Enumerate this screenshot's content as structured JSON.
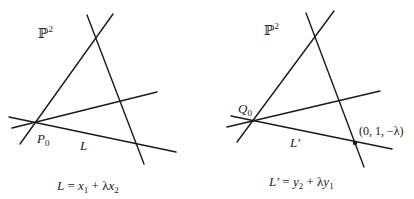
{
  "left_panel": {
    "space_label": "ℙ",
    "space_sup": "2",
    "point_label": "P",
    "point_sub": "0",
    "line_label": "L",
    "formula": {
      "lhs": "L",
      "eq": " = ",
      "t1": "x",
      "t1_sub": "1",
      "plus": " + λ",
      "t2": "x",
      "t2_sub": "2"
    }
  },
  "right_panel": {
    "space_label": "ℙ",
    "space_sup": "2",
    "point_label": "Q",
    "point_sub": "0",
    "line_label": "L′",
    "marked_point_label": "(0, 1, −λ)",
    "formula": {
      "lhs": "L′",
      "eq": " = ",
      "t1": "y",
      "t1_sub": "2",
      "plus": " + λ",
      "t2": "y",
      "t2_sub": "1"
    }
  },
  "colors": {
    "ink": "#1a1a1a",
    "background": "#ffffff"
  }
}
